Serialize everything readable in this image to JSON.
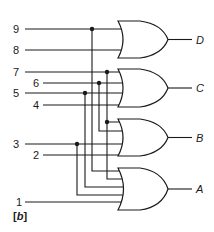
{
  "diagram": {
    "type": "logic-circuit",
    "caption": "[b]",
    "caption_parts": {
      "open": "[",
      "letter": "b",
      "close": "]"
    },
    "inputs": [
      {
        "label": "9",
        "y": 29
      },
      {
        "label": "8",
        "y": 50
      },
      {
        "label": "7",
        "y": 72
      },
      {
        "label": "6",
        "y": 83
      },
      {
        "label": "5",
        "y": 93
      },
      {
        "label": "4",
        "y": 105
      },
      {
        "label": "3",
        "y": 144
      },
      {
        "label": "2",
        "y": 155
      },
      {
        "label": "1",
        "y": 202
      }
    ],
    "gates": [
      {
        "name": "D",
        "kind": "OR",
        "inputs": [
          "9",
          "8"
        ]
      },
      {
        "name": "C",
        "kind": "OR",
        "inputs": [
          "7",
          "6",
          "5",
          "4"
        ]
      },
      {
        "name": "B",
        "kind": "OR",
        "inputs": [
          "7",
          "6",
          "3",
          "2"
        ]
      },
      {
        "name": "A",
        "kind": "OR",
        "inputs": [
          "9",
          "7",
          "5",
          "3",
          "1"
        ]
      }
    ],
    "outputs": [
      {
        "label": "D"
      },
      {
        "label": "C"
      },
      {
        "label": "B"
      },
      {
        "label": "A"
      }
    ]
  }
}
